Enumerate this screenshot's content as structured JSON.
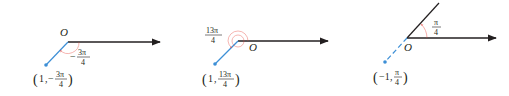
{
  "colors": {
    "axis": "#231f20",
    "point_ray": "#3d8fd6",
    "angle_arc": "#e8433a",
    "background": "#ffffff"
  },
  "panels": [
    {
      "origin_label": "O",
      "angle": {
        "sign": "−",
        "num": "3π",
        "den": "4"
      },
      "point": {
        "r": "1",
        "sign": "−",
        "num": "3π",
        "den": "4"
      }
    },
    {
      "origin_label": "O",
      "angle": {
        "sign": "",
        "num": "13π",
        "den": "4"
      },
      "point": {
        "r": "1",
        "sign": "",
        "num": "13π",
        "den": "4"
      }
    },
    {
      "origin_label": "O",
      "angle": {
        "sign": "",
        "num": "π",
        "den": "4"
      },
      "point": {
        "r": "−1",
        "sign": "",
        "num": "π",
        "den": "4"
      }
    }
  ]
}
